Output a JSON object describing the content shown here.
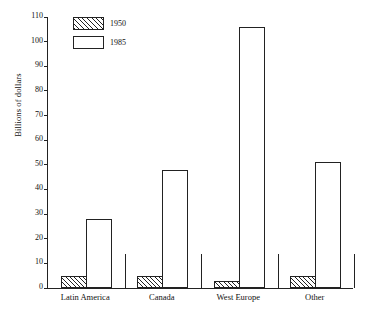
{
  "chart_data": {
    "type": "bar",
    "title": "",
    "xlabel": "",
    "ylabel": "Billions of dollars",
    "ylim": [
      0,
      110
    ],
    "ytick_step": 10,
    "yticks": [
      0,
      10,
      20,
      30,
      40,
      50,
      60,
      70,
      80,
      90,
      100,
      110
    ],
    "grid": false,
    "legend_position": "top-left",
    "categories": [
      "Latin America",
      "Canada",
      "West Europe",
      "Other"
    ],
    "series": [
      {
        "name": "1950",
        "fill": "hatched",
        "values": [
          5,
          5,
          3,
          5
        ]
      },
      {
        "name": "1985",
        "fill": "white",
        "values": [
          28,
          48,
          106,
          51
        ]
      }
    ]
  },
  "legend": {
    "items": [
      {
        "label": "1950",
        "fill": "hatched"
      },
      {
        "label": "1985",
        "fill": "white"
      }
    ]
  },
  "colors": {
    "axis": "#222222",
    "bar_fill": "#ffffff",
    "hatch": "#222222",
    "background": "#ffffff"
  }
}
